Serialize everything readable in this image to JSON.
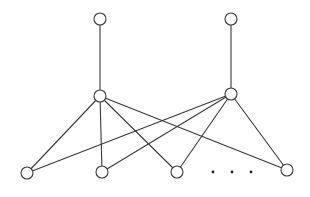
{
  "diagram": {
    "type": "bipartite-graph",
    "stroke_color": "#3a3a3a",
    "node_fill": "#ffffff",
    "node_radius": 6,
    "nodes": [
      {
        "id": "top-left",
        "x": 100,
        "y": 19
      },
      {
        "id": "top-right",
        "x": 231,
        "y": 19
      },
      {
        "id": "mid-left",
        "x": 100,
        "y": 96
      },
      {
        "id": "mid-right",
        "x": 231,
        "y": 94
      },
      {
        "id": "bottom-1",
        "x": 27,
        "y": 173
      },
      {
        "id": "bottom-2",
        "x": 102,
        "y": 172
      },
      {
        "id": "bottom-3",
        "x": 177,
        "y": 172
      },
      {
        "id": "bottom-4",
        "x": 287,
        "y": 170
      }
    ],
    "edges": [
      [
        "top-left",
        "mid-left"
      ],
      [
        "top-right",
        "mid-right"
      ],
      [
        "mid-left",
        "bottom-1"
      ],
      [
        "mid-left",
        "bottom-2"
      ],
      [
        "mid-left",
        "bottom-3"
      ],
      [
        "mid-left",
        "bottom-4"
      ],
      [
        "mid-right",
        "bottom-1"
      ],
      [
        "mid-right",
        "bottom-2"
      ],
      [
        "mid-right",
        "bottom-3"
      ],
      [
        "mid-right",
        "bottom-4"
      ]
    ],
    "ellipsis": {
      "label": "· · ·",
      "dots": [
        {
          "x": 213,
          "y": 172
        },
        {
          "x": 232,
          "y": 172
        },
        {
          "x": 251,
          "y": 172
        }
      ]
    }
  }
}
